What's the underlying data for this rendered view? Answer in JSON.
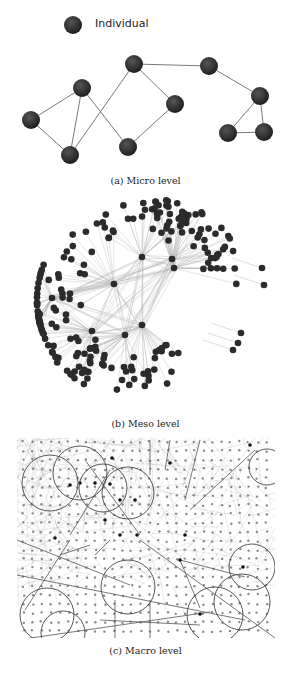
{
  "legend": {
    "label": "Individual",
    "node": [
      73,
      25
    ]
  },
  "colors": {
    "node": "#2b2b2b",
    "edge": "#7a7a7a",
    "light_edge": "#b0b0b0",
    "dot": "#8a8a8a",
    "circle": "#444444"
  },
  "panels": {
    "micro": {
      "caption": "(a) Micro level",
      "nodes": [
        [
          31,
          120
        ],
        [
          82,
          88
        ],
        [
          70,
          155
        ],
        [
          134,
          64
        ],
        [
          175,
          104
        ],
        [
          128,
          147
        ],
        [
          209,
          66
        ],
        [
          260,
          96
        ],
        [
          228,
          133
        ],
        [
          264,
          132
        ]
      ],
      "edges": [
        [
          0,
          1
        ],
        [
          0,
          2
        ],
        [
          1,
          2
        ],
        [
          1,
          5
        ],
        [
          2,
          3
        ],
        [
          3,
          4
        ],
        [
          4,
          5
        ],
        [
          3,
          6
        ],
        [
          6,
          7
        ],
        [
          7,
          8
        ],
        [
          7,
          9
        ],
        [
          8,
          9
        ]
      ]
    },
    "meso": {
      "caption": "(b) Meso level",
      "hubs": [
        [
          142,
          257
        ],
        [
          172,
          259
        ],
        [
          174,
          268
        ],
        [
          114,
          284
        ],
        [
          52,
          298
        ],
        [
          92,
          331
        ],
        [
          125,
          335
        ],
        [
          142,
          325
        ]
      ],
      "outliers": [
        [
          262,
          268
        ],
        [
          264,
          285
        ],
        [
          241,
          333
        ],
        [
          238,
          343
        ],
        [
          233,
          350
        ]
      ]
    },
    "macro": {
      "caption": "(c) Macro level",
      "area": [
        17,
        438,
        275,
        638
      ],
      "circles": [
        [
          50,
          483,
          28
        ],
        [
          80,
          473,
          27
        ],
        [
          103,
          488,
          24
        ],
        [
          128,
          493,
          26
        ],
        [
          128,
          587,
          27
        ],
        [
          267,
          467,
          18
        ],
        [
          252,
          567,
          23
        ],
        [
          242,
          602,
          28
        ],
        [
          215,
          615,
          28
        ],
        [
          47,
          615,
          27
        ],
        [
          63,
          633,
          22
        ]
      ]
    }
  }
}
